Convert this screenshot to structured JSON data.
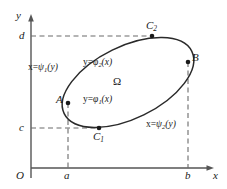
{
  "figure": {
    "type": "math-diagram",
    "colors": {
      "ink": "#1a1a1a",
      "axis": "#555555",
      "curve": "#2a2a2a",
      "dashed": "#6b6b6b",
      "background": "#ffffff"
    }
  },
  "axes": {
    "y_label": "y",
    "x_label": "x",
    "origin_label": "O"
  },
  "ticks": {
    "x": [
      {
        "id": "a",
        "label": "a"
      },
      {
        "id": "b",
        "label": "b"
      }
    ],
    "y": [
      {
        "id": "c",
        "label": "c"
      },
      {
        "id": "d",
        "label": "d"
      }
    ]
  },
  "points": [
    {
      "id": "A",
      "label": "A",
      "sub": "",
      "role": "left-tangent-point"
    },
    {
      "id": "B",
      "label": "B",
      "sub": "",
      "role": "right-tangent-point"
    },
    {
      "id": "C1",
      "label": "C",
      "sub": "1",
      "role": "bottom-tangent-point"
    },
    {
      "id": "C2",
      "label": "C",
      "sub": "2",
      "role": "top-tangent-point"
    }
  ],
  "region": {
    "label": "Ω"
  },
  "boundary_labels": [
    {
      "id": "psi1",
      "lhs": "x=",
      "fn": "ψ",
      "sub": "1",
      "arg": "(y)",
      "position": "left"
    },
    {
      "id": "psi2",
      "lhs": "x=",
      "fn": "ψ",
      "sub": "2",
      "arg": "(y)",
      "position": "right"
    },
    {
      "id": "phi1",
      "lhs": "y=",
      "fn": "φ",
      "sub": "1",
      "arg": "(x)",
      "position": "lower-interior"
    },
    {
      "id": "phi2",
      "lhs": "y=",
      "fn": "φ",
      "sub": "2",
      "arg": "(x)",
      "position": "upper-interior"
    }
  ]
}
